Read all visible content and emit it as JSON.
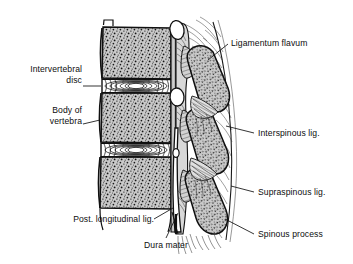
{
  "figure": {
    "type": "anatomical-line-drawing",
    "background_color": "#ffffff",
    "ink_color": "#111111",
    "bone_fill_color": "#c9c9c9",
    "stipple_color": "#1a1a1a",
    "white_space_color": "#ffffff"
  },
  "labels": {
    "intervertebral_disc": "Intervertebral\ndisc",
    "body_of_vertebra": "Body of\nvertebra",
    "post_longitudinal_lig": "Post. longitudinal lig.",
    "dura_mater": "Dura mater",
    "ligamentum_flavum": "Ligamentum flavum",
    "interspinous_lig": "Interspinous lig.",
    "supraspinous_lig": "Supraspinous lig.",
    "spinous_process": "Spinous process"
  },
  "structures": [
    {
      "name": "vertebral-body",
      "count": 3
    },
    {
      "name": "intervertebral-disc",
      "count": 2
    },
    {
      "name": "spinous-process",
      "count": 3
    },
    {
      "name": "spinal-canal",
      "count": 1
    },
    {
      "name": "dura-mater",
      "count": 1
    },
    {
      "name": "ligamentum-flavum",
      "count": 3
    },
    {
      "name": "interspinous-ligament",
      "count": 2
    },
    {
      "name": "supraspinous-ligament",
      "count": 1
    },
    {
      "name": "posterior-longitudinal-ligament",
      "count": 1
    }
  ]
}
